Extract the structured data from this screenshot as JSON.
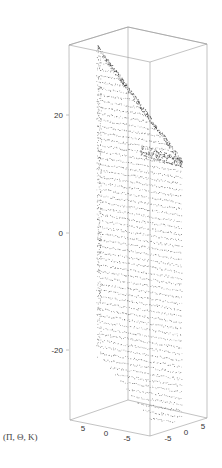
{
  "chart_data": {
    "type": "scatter",
    "subtype": "3d-point-cloud",
    "title": "",
    "label": "(Π, Θ, K)",
    "axes": {
      "x": {
        "ticks": [
          5,
          0,
          -5
        ],
        "range": [
          -7,
          7
        ]
      },
      "y": {
        "ticks": [
          -5,
          0,
          5
        ],
        "range": [
          -7,
          7
        ]
      },
      "z": {
        "ticks": [
          20,
          0,
          -20
        ],
        "range": [
          -32,
          32
        ]
      }
    },
    "box": true,
    "grid": false,
    "legend": null,
    "point_color": "#222222"
  },
  "labels": {
    "corner_label": "(Π, Θ, K)",
    "z_ticks": [
      "20",
      "0",
      "-20"
    ],
    "x_ticks": [
      "5",
      "0",
      "-5"
    ],
    "y_ticks": [
      "-5",
      "0",
      "5"
    ]
  }
}
